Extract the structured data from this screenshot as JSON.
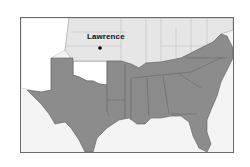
{
  "map": {
    "region": "Southern United States",
    "colors": {
      "shaded_states": "#8c8c8c",
      "northern_states": "#e6e6e6",
      "western_territories": "#ffffff",
      "water": "#f4f4f4",
      "borders": "#5f5f5f",
      "frame": "#6a6a6a"
    },
    "markers": [
      {
        "label": "Lawrence",
        "type": "city-dot"
      }
    ]
  }
}
